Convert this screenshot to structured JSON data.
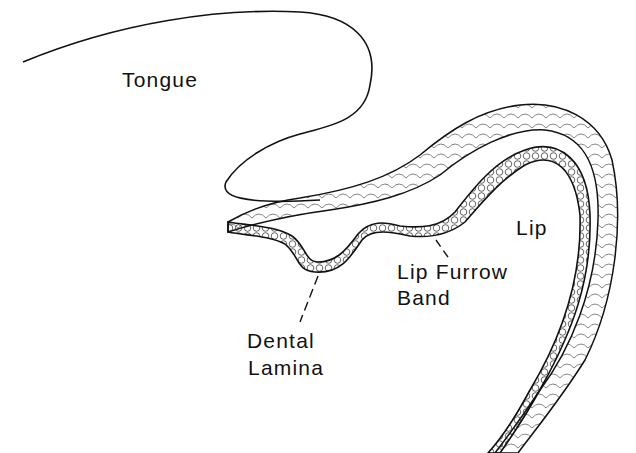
{
  "figure": {
    "labels": {
      "tongue": "Tongue",
      "lip": "Lip",
      "lip_furrow_band_line1": "Lip Furrow",
      "lip_furrow_band_line2": "Band",
      "dental_lamina_line1": "Dental",
      "dental_lamina_line2": "Lamina"
    },
    "colors": {
      "background": "#ffffff",
      "ink": "#111111"
    }
  }
}
